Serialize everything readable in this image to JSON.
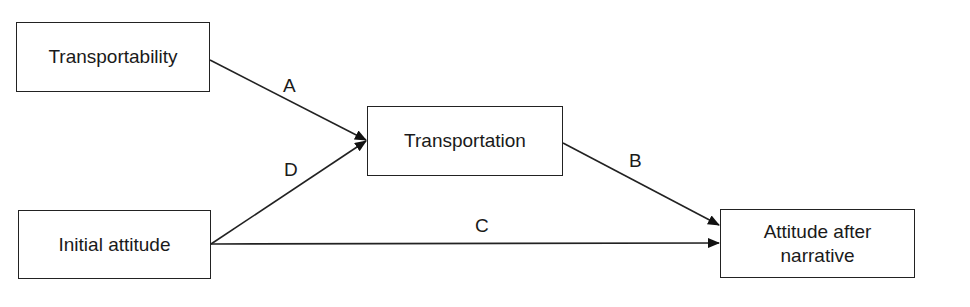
{
  "diagram": {
    "type": "path-model",
    "nodes": [
      {
        "id": "transportability",
        "label": "Transportability"
      },
      {
        "id": "transportation",
        "label": "Transportation"
      },
      {
        "id": "initial_attitude",
        "label": "Initial attitude"
      },
      {
        "id": "attitude_after",
        "label": "Attitude after narrative",
        "line1": "Attitude after",
        "line2": "narrative"
      }
    ],
    "edges": [
      {
        "from": "transportability",
        "to": "transportation",
        "label": "A"
      },
      {
        "from": "transportation",
        "to": "attitude_after",
        "label": "B"
      },
      {
        "from": "initial_attitude",
        "to": "attitude_after",
        "label": "C"
      },
      {
        "from": "initial_attitude",
        "to": "transportation",
        "label": "D"
      }
    ]
  }
}
